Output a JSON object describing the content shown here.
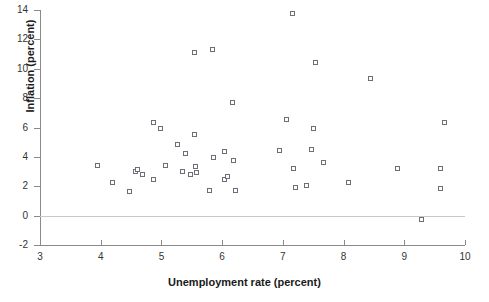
{
  "chart_data": {
    "type": "scatter",
    "title": "",
    "xlabel": "Unemployment rate (percent)",
    "ylabel": "Inflation (percent)",
    "xlim": [
      3,
      10
    ],
    "ylim": [
      -2,
      14
    ],
    "xticks": [
      "3",
      "4",
      "5",
      "6",
      "7",
      "8",
      "9",
      "10"
    ],
    "xtick_values": [
      3,
      4,
      5,
      6,
      7,
      8,
      9,
      10
    ],
    "yticks": [
      "-2",
      "0",
      "2",
      "4",
      "6",
      "8",
      "10",
      "12",
      "14"
    ],
    "ytick_values": [
      -2,
      0,
      2,
      4,
      6,
      8,
      10,
      12,
      14
    ],
    "grid": false,
    "legend": "none",
    "marker_style": "open-square",
    "marker_color": "#6e6e78",
    "zero_line": true,
    "points": [
      {
        "x": 3.96,
        "y": 3.4
      },
      {
        "x": 4.2,
        "y": 2.2
      },
      {
        "x": 4.48,
        "y": 1.6
      },
      {
        "x": 4.58,
        "y": 3.0
      },
      {
        "x": 4.62,
        "y": 3.1
      },
      {
        "x": 4.7,
        "y": 2.8
      },
      {
        "x": 4.88,
        "y": 6.3
      },
      {
        "x": 4.99,
        "y": 5.9
      },
      {
        "x": 4.87,
        "y": 2.4
      },
      {
        "x": 5.08,
        "y": 3.4
      },
      {
        "x": 5.28,
        "y": 4.8
      },
      {
        "x": 5.35,
        "y": 3.0
      },
      {
        "x": 5.41,
        "y": 4.2
      },
      {
        "x": 5.48,
        "y": 2.8
      },
      {
        "x": 5.55,
        "y": 11.1
      },
      {
        "x": 5.55,
        "y": 5.5
      },
      {
        "x": 5.57,
        "y": 3.3
      },
      {
        "x": 5.58,
        "y": 2.9
      },
      {
        "x": 5.8,
        "y": 1.7
      },
      {
        "x": 5.85,
        "y": 11.3
      },
      {
        "x": 5.87,
        "y": 3.9
      },
      {
        "x": 6.04,
        "y": 4.3
      },
      {
        "x": 6.05,
        "y": 2.4
      },
      {
        "x": 6.1,
        "y": 2.6
      },
      {
        "x": 6.18,
        "y": 7.7
      },
      {
        "x": 6.19,
        "y": 3.7
      },
      {
        "x": 6.22,
        "y": 1.7
      },
      {
        "x": 6.96,
        "y": 4.4
      },
      {
        "x": 7.07,
        "y": 6.5
      },
      {
        "x": 7.17,
        "y": 13.7
      },
      {
        "x": 7.19,
        "y": 3.2
      },
      {
        "x": 7.22,
        "y": 1.9
      },
      {
        "x": 7.4,
        "y": 2.0
      },
      {
        "x": 7.48,
        "y": 4.5
      },
      {
        "x": 7.52,
        "y": 5.9
      },
      {
        "x": 7.55,
        "y": 10.4
      },
      {
        "x": 7.68,
        "y": 3.6
      },
      {
        "x": 8.09,
        "y": 2.2
      },
      {
        "x": 8.45,
        "y": 9.3
      },
      {
        "x": 8.9,
        "y": 3.2
      },
      {
        "x": 9.29,
        "y": -0.3
      },
      {
        "x": 9.61,
        "y": 3.2
      },
      {
        "x": 9.61,
        "y": 1.8
      },
      {
        "x": 9.67,
        "y": 6.3
      }
    ]
  },
  "geometry": {
    "x_pixel_at_min": 40,
    "x_pixel_at_max": 465,
    "y_pixel_at_min": 245,
    "y_pixel_at_max": 10
  }
}
